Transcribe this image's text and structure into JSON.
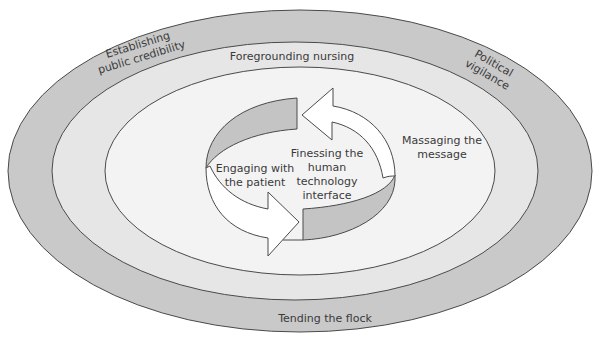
{
  "diagram": {
    "layers": {
      "outer": {
        "labels": {
          "top_left": [
            "Establishing",
            "public credibility"
          ],
          "top_right": [
            "Political",
            "vigilance"
          ],
          "bottom": "Tending the flock"
        },
        "fill": "#c9c9c9"
      },
      "middle": {
        "label": "Foregrounding nursing",
        "fill": "#e6e6e6"
      },
      "inner": {
        "label": [
          "Massaging the",
          "message"
        ],
        "fill": "#f3f3f3"
      }
    },
    "cycle": {
      "left_label": [
        "Engaging with",
        "the patient"
      ],
      "center_label": [
        "Finessing the",
        "human",
        "technology",
        "interface"
      ],
      "band_fill": "#c4c4c4",
      "arrow_fill": "#ffffff"
    },
    "colors": {
      "stroke": "#4a4a4a",
      "text": "#3a3a3a"
    }
  }
}
